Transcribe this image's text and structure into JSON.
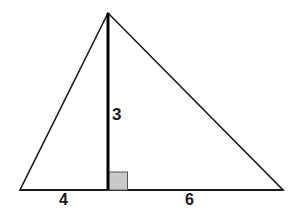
{
  "figure": {
    "kind": "triangle-with-altitude",
    "background_color": "#ffffff",
    "stroke_color": "#1a1a1a",
    "altitude_color": "#000000",
    "right_angle_fill": "#c9c9c9",
    "right_angle_stroke": "#555555",
    "vertices": {
      "apex": {
        "x": 108,
        "y": 13
      },
      "bottom_left": {
        "x": 20,
        "y": 190
      },
      "bottom_right": {
        "x": 283,
        "y": 190
      },
      "altitude_foot": {
        "x": 108,
        "y": 190
      }
    },
    "right_angle_marker": {
      "x": 108,
      "y": 172,
      "width": 19,
      "height": 18
    }
  },
  "labels": {
    "altitude": "3",
    "base_left_segment": "4",
    "base_right_segment": "6"
  },
  "chart_data": {
    "type": "diagram",
    "title": "",
    "shape": "triangle",
    "measurements": [
      {
        "name": "height",
        "label": "3",
        "value": 3
      },
      {
        "name": "base-left-segment",
        "label": "4",
        "value": 4
      },
      {
        "name": "base-right-segment",
        "label": "6",
        "value": 6
      }
    ],
    "derived": {
      "base_total": 10
    }
  }
}
